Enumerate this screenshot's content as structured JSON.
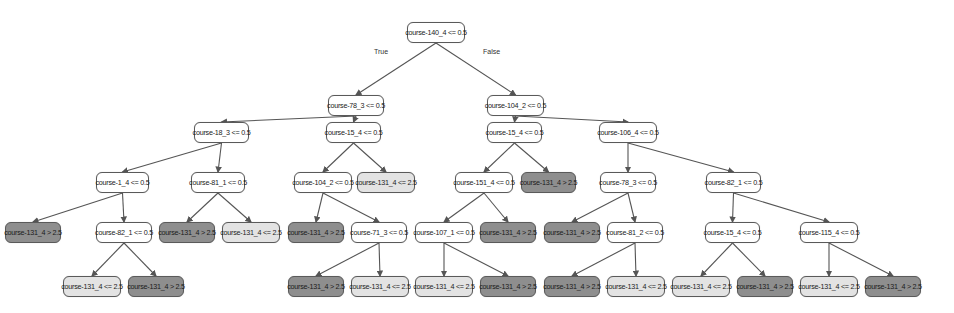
{
  "diagram": {
    "type": "decision-tree",
    "edge_labels": {
      "true": "True",
      "false": "False"
    },
    "colors": {
      "split": "#ffffff",
      "leaf_le": "#e3e3e3",
      "leaf_gt": "#8e8e8e",
      "edge": "#555555"
    },
    "nodes": [
      {
        "id": "n0",
        "label": "course-140_4 <= 0.5",
        "kind": "split",
        "x": 407,
        "y": 22,
        "w": 58
      },
      {
        "id": "n1",
        "label": "course-78_3 <= 0.5",
        "kind": "split",
        "x": 328,
        "y": 95,
        "w": 56
      },
      {
        "id": "n2",
        "label": "course-104_2 <= 0.5",
        "kind": "split",
        "x": 487,
        "y": 95,
        "w": 57
      },
      {
        "id": "n3",
        "label": "course-18_3 <= 0.5",
        "kind": "split",
        "x": 194,
        "y": 122,
        "w": 55
      },
      {
        "id": "n4",
        "label": "course-15_4 <= 0.5",
        "kind": "split",
        "x": 326,
        "y": 122,
        "w": 55
      },
      {
        "id": "n5",
        "label": "course-15_4 <= 0.5",
        "kind": "split",
        "x": 487,
        "y": 122,
        "w": 55
      },
      {
        "id": "n6",
        "label": "course-106_4 <= 0.5",
        "kind": "split",
        "x": 599,
        "y": 122,
        "w": 58
      },
      {
        "id": "n7",
        "label": "course-1_4 <= 0.5",
        "kind": "split",
        "x": 96,
        "y": 172,
        "w": 53
      },
      {
        "id": "n8",
        "label": "course-81_1 <= 0.5",
        "kind": "split",
        "x": 191,
        "y": 172,
        "w": 54
      },
      {
        "id": "n9",
        "label": "course-104_2 <= 0.5",
        "kind": "split",
        "x": 294,
        "y": 172,
        "w": 58
      },
      {
        "id": "n10",
        "label": "course-131_4 <= 2.5",
        "kind": "leaf-le",
        "x": 357,
        "y": 172,
        "w": 58
      },
      {
        "id": "n11",
        "label": "course-151_4 <= 0.5",
        "kind": "split",
        "x": 455,
        "y": 172,
        "w": 58
      },
      {
        "id": "n12",
        "label": "course-131_4 > 2.5",
        "kind": "leaf-gt",
        "x": 521,
        "y": 172,
        "w": 55
      },
      {
        "id": "n13",
        "label": "course-78_3 <= 0.5",
        "kind": "split",
        "x": 600,
        "y": 172,
        "w": 56
      },
      {
        "id": "n14",
        "label": "course-82_1 <= 0.5",
        "kind": "split",
        "x": 706,
        "y": 172,
        "w": 55
      },
      {
        "id": "n15",
        "label": "course-131_4 > 2.5",
        "kind": "leaf-gt",
        "x": 5,
        "y": 222,
        "w": 56
      },
      {
        "id": "n16",
        "label": "course-82_1 <= 0.5",
        "kind": "split",
        "x": 96,
        "y": 222,
        "w": 56
      },
      {
        "id": "n17",
        "label": "course-131_4 > 2.5",
        "kind": "leaf-gt",
        "x": 159,
        "y": 222,
        "w": 56
      },
      {
        "id": "n18",
        "label": "course-131_4 <= 2.5",
        "kind": "leaf-le",
        "x": 222,
        "y": 222,
        "w": 58
      },
      {
        "id": "n19",
        "label": "course-131_4 > 2.5",
        "kind": "leaf-gt",
        "x": 288,
        "y": 222,
        "w": 56
      },
      {
        "id": "n20",
        "label": "course-71_3 <= 0.5",
        "kind": "split",
        "x": 351,
        "y": 222,
        "w": 56
      },
      {
        "id": "n21",
        "label": "course-107_1 <= 0.5",
        "kind": "split",
        "x": 415,
        "y": 222,
        "w": 58
      },
      {
        "id": "n22",
        "label": "course-131_4 > 2.5",
        "kind": "leaf-gt",
        "x": 480,
        "y": 222,
        "w": 56
      },
      {
        "id": "n23",
        "label": "course-131_4 > 2.5",
        "kind": "leaf-gt",
        "x": 544,
        "y": 222,
        "w": 56
      },
      {
        "id": "n24",
        "label": "course-81_2 <= 0.5",
        "kind": "split",
        "x": 607,
        "y": 222,
        "w": 56
      },
      {
        "id": "n25",
        "label": "course-15_4 <= 0.5",
        "kind": "split",
        "x": 705,
        "y": 222,
        "w": 55
      },
      {
        "id": "n26",
        "label": "course-115_4 <= 0.5",
        "kind": "split",
        "x": 800,
        "y": 222,
        "w": 58
      },
      {
        "id": "n27",
        "label": "course-131_4 <= 2.5",
        "kind": "leaf-le",
        "x": 63,
        "y": 276,
        "w": 58
      },
      {
        "id": "n28",
        "label": "course-131_4 > 2.5",
        "kind": "leaf-gt",
        "x": 128,
        "y": 276,
        "w": 56
      },
      {
        "id": "n29",
        "label": "course-131_4 > 2.5",
        "kind": "leaf-gt",
        "x": 288,
        "y": 276,
        "w": 56
      },
      {
        "id": "n30",
        "label": "course-131_4 <= 2.5",
        "kind": "leaf-le",
        "x": 351,
        "y": 276,
        "w": 58
      },
      {
        "id": "n31",
        "label": "course-131_4 <= 2.5",
        "kind": "leaf-le",
        "x": 415,
        "y": 276,
        "w": 58
      },
      {
        "id": "n32",
        "label": "course-131_4 > 2.5",
        "kind": "leaf-gt",
        "x": 480,
        "y": 276,
        "w": 56
      },
      {
        "id": "n33",
        "label": "course-131_4 > 2.5",
        "kind": "leaf-gt",
        "x": 544,
        "y": 276,
        "w": 56
      },
      {
        "id": "n34",
        "label": "course-131_4 <= 2.5",
        "kind": "leaf-le",
        "x": 607,
        "y": 276,
        "w": 58
      },
      {
        "id": "n35",
        "label": "course-131_4 <= 2.5",
        "kind": "leaf-le",
        "x": 672,
        "y": 276,
        "w": 58
      },
      {
        "id": "n36",
        "label": "course-131_4 > 2.5",
        "kind": "leaf-gt",
        "x": 737,
        "y": 276,
        "w": 56
      },
      {
        "id": "n37",
        "label": "course-131_4 <= 2.5",
        "kind": "leaf-le",
        "x": 800,
        "y": 276,
        "w": 58
      },
      {
        "id": "n38",
        "label": "course-131_4 > 2.5",
        "kind": "leaf-gt",
        "x": 865,
        "y": 276,
        "w": 56
      }
    ],
    "edges": [
      [
        "n0",
        "n1"
      ],
      [
        "n0",
        "n2"
      ],
      [
        "n1",
        "n3"
      ],
      [
        "n1",
        "n4"
      ],
      [
        "n2",
        "n5"
      ],
      [
        "n2",
        "n6"
      ],
      [
        "n3",
        "n7"
      ],
      [
        "n3",
        "n8"
      ],
      [
        "n4",
        "n9"
      ],
      [
        "n4",
        "n10"
      ],
      [
        "n5",
        "n11"
      ],
      [
        "n5",
        "n12"
      ],
      [
        "n6",
        "n13"
      ],
      [
        "n6",
        "n14"
      ],
      [
        "n7",
        "n15"
      ],
      [
        "n7",
        "n16"
      ],
      [
        "n8",
        "n17"
      ],
      [
        "n8",
        "n18"
      ],
      [
        "n9",
        "n19"
      ],
      [
        "n9",
        "n20"
      ],
      [
        "n11",
        "n21"
      ],
      [
        "n11",
        "n22"
      ],
      [
        "n13",
        "n23"
      ],
      [
        "n13",
        "n24"
      ],
      [
        "n14",
        "n25"
      ],
      [
        "n14",
        "n26"
      ],
      [
        "n16",
        "n27"
      ],
      [
        "n16",
        "n28"
      ],
      [
        "n20",
        "n29"
      ],
      [
        "n20",
        "n30"
      ],
      [
        "n21",
        "n31"
      ],
      [
        "n21",
        "n32"
      ],
      [
        "n24",
        "n33"
      ],
      [
        "n24",
        "n34"
      ],
      [
        "n25",
        "n35"
      ],
      [
        "n25",
        "n36"
      ],
      [
        "n26",
        "n37"
      ],
      [
        "n26",
        "n38"
      ]
    ]
  }
}
